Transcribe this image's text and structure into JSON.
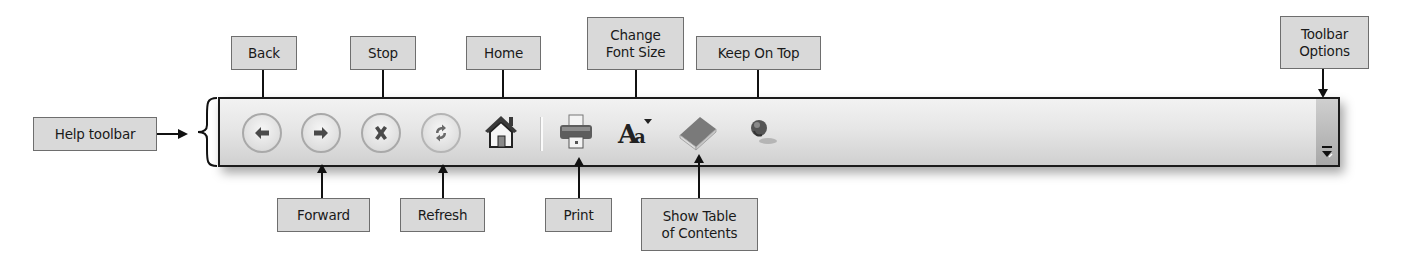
{
  "title": "Help toolbar",
  "callouts": {
    "help_toolbar": "Help toolbar",
    "back": "Back",
    "forward": "Forward",
    "stop": "Stop",
    "refresh": "Refresh",
    "home": "Home",
    "print": "Print",
    "change_font_size": "Change\nFont Size",
    "show_toc": "Show Table\nof Contents",
    "keep_on_top": "Keep On Top",
    "toolbar_options": "Toolbar\nOptions"
  },
  "toolbar": {
    "buttons": [
      {
        "id": "back",
        "icon": "arrow-left-icon"
      },
      {
        "id": "forward",
        "icon": "arrow-right-icon"
      },
      {
        "id": "stop",
        "icon": "x-icon"
      },
      {
        "id": "refresh",
        "icon": "refresh-icon"
      },
      {
        "id": "home",
        "icon": "house-icon"
      },
      {
        "id": "print",
        "icon": "printer-icon"
      },
      {
        "id": "change_font_size",
        "icon": "font-size-icon"
      },
      {
        "id": "show_toc",
        "icon": "book-icon"
      },
      {
        "id": "keep_on_top",
        "icon": "pushpin-icon"
      },
      {
        "id": "toolbar_options",
        "icon": "overflow-chevron-icon"
      }
    ],
    "font_glyph": "Aa"
  },
  "colors": {
    "callout_bg": "#d9d9d9",
    "callout_border": "#6e6e6e",
    "toolbar_border": "#1b1b1b",
    "icon_gray": "#555555"
  }
}
